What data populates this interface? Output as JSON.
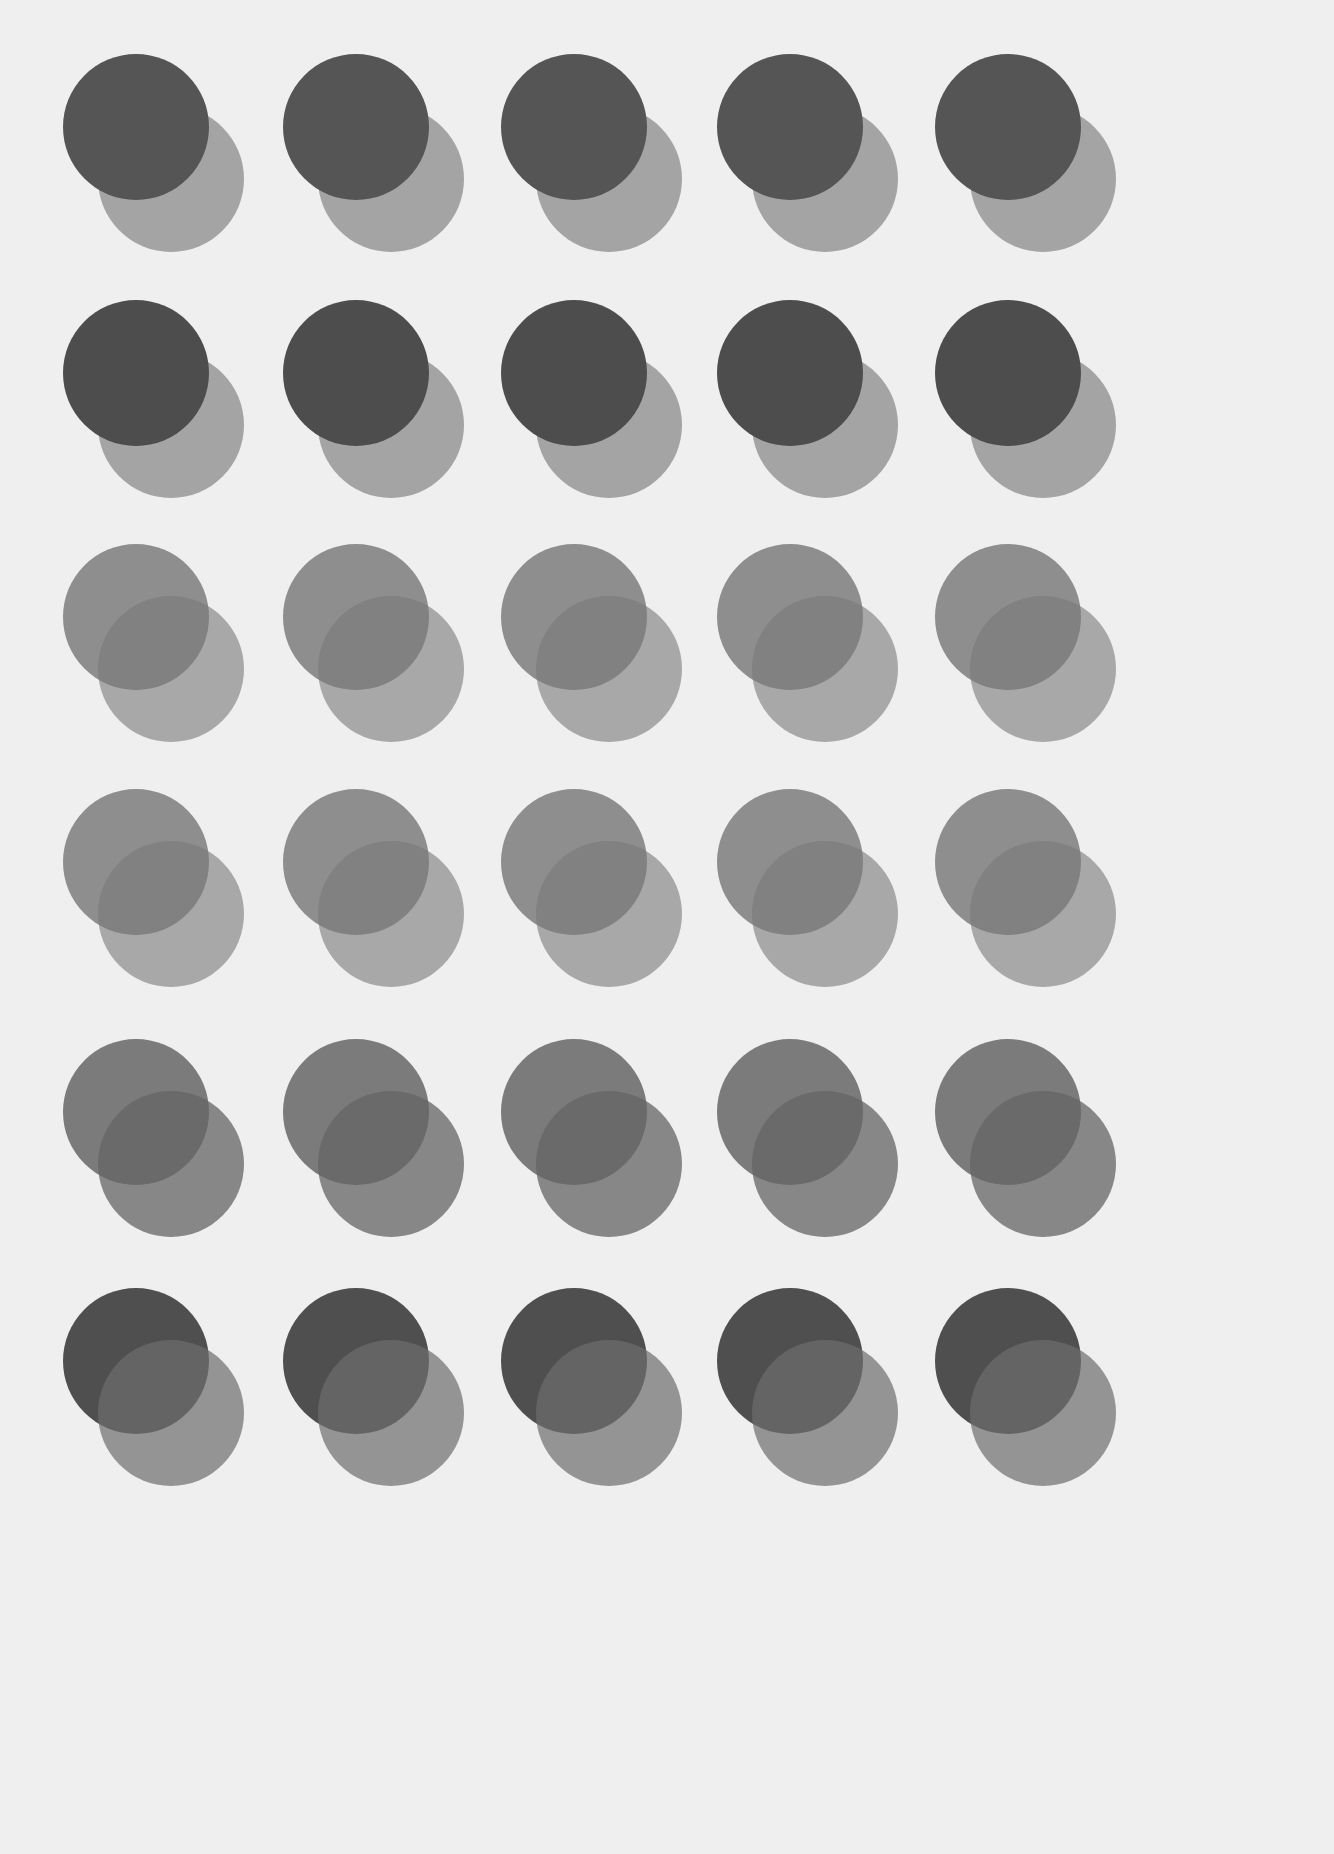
{
  "canvas": {
    "width": 1334,
    "height": 1854,
    "background": "#efefef"
  },
  "layout": {
    "columns_x": [
      136,
      356,
      574,
      790,
      1008
    ],
    "rows_y": [
      127,
      373,
      617,
      862,
      1112,
      1361
    ],
    "radius": 73,
    "back_offset": [
      35,
      52
    ]
  },
  "rows": [
    {
      "front": "#555555",
      "back": "rgba(150,150,150,0.85)",
      "front_on_top": true
    },
    {
      "front": "#4d4d4d",
      "back": "rgba(150,150,150,0.85)",
      "front_on_top": true
    },
    {
      "front": "rgba(125,125,125,0.85)",
      "back": "rgba(120,120,120,0.6)",
      "front_on_top": false
    },
    {
      "front": "rgba(125,125,125,0.85)",
      "back": "rgba(120,120,120,0.6)",
      "front_on_top": false
    },
    {
      "front": "rgba(110,110,110,0.9)",
      "back": "rgba(100,100,100,0.75)",
      "front_on_top": false
    },
    {
      "front": "#4f4f4f",
      "back": "rgba(110,110,110,0.7)",
      "front_on_top": false
    }
  ]
}
